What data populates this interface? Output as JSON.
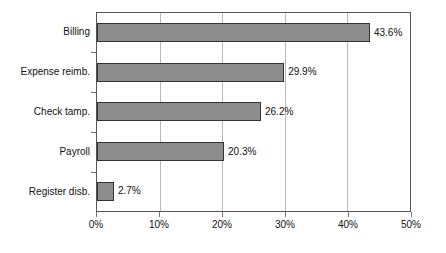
{
  "chart_data": {
    "type": "bar",
    "orientation": "horizontal",
    "title": "",
    "subtitle": "",
    "xlabel": "",
    "ylabel": "",
    "categories": [
      "Billing",
      "Expense reimb.",
      "Check tamp.",
      "Payroll",
      "Register disb."
    ],
    "values": [
      43.6,
      29.9,
      26.2,
      20.3,
      2.7
    ],
    "value_labels": [
      "43.6%",
      "29.9%",
      "26.2%",
      "20.3%",
      "2.7%"
    ],
    "xlim": [
      0,
      50
    ],
    "xtick_values": [
      0,
      10,
      20,
      30,
      40,
      50
    ],
    "xtick_labels": [
      "0%",
      "10%",
      "20%",
      "30%",
      "40%",
      "50%"
    ],
    "grid": "vertical",
    "legend": "none",
    "series": [
      {
        "name": "",
        "values": [
          43.6,
          29.9,
          26.2,
          20.3,
          2.7
        ]
      }
    ]
  },
  "style": {
    "bar_fill": "#8d8d8d",
    "bar_border": "#333333",
    "plot_border": "#555555",
    "gridline": "#b9b9b9",
    "background": "#ffffff",
    "text": "#111111"
  }
}
